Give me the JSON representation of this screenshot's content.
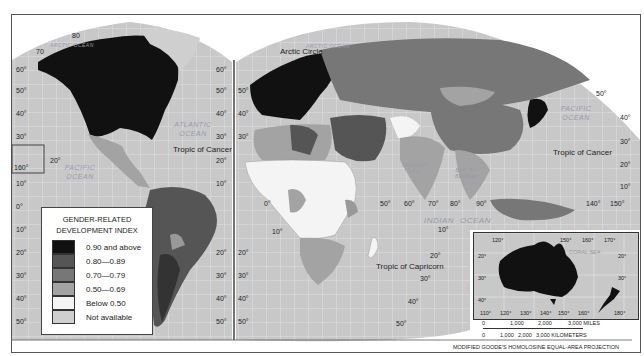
{
  "map": {
    "projection_note": "MODIFIED GOODE'S HOMOLOSINE EQUAL-AREA PROJECTION",
    "colors": {
      "ocean": "#c8c8c8",
      "grid": "#e8e8e8",
      "gdi_090_above": "#111111",
      "gdi_080_089": "#555555",
      "gdi_070_079": "#777777",
      "gdi_050_069": "#a3a3a3",
      "gdi_below_050": "#f4f4f4",
      "not_available": "#cfcfcf"
    },
    "labels": {
      "arctic_circle": "Arctic Circle",
      "tropic_cancer_west": "Tropic of Cancer",
      "tropic_cancer_east": "Tropic of Cancer",
      "tropic_capricorn": "Tropic of Capricorn",
      "arctic_ocean_west": "ARCTIC OCEAN",
      "arctic_ocean_east": "ARCTIC OCEAN",
      "atlantic_ocean": "ATLANTIC OCEAN",
      "pacific_ocean_west": "PACIFIC OCEAN",
      "pacific_ocean_east": "PACIFIC OCEAN",
      "indian_ocean_1": "INDIAN",
      "indian_ocean_2": "OCEAN",
      "arabian_sea": "ARABIAN SEA",
      "bay_of_bengal": "BAY OF BENGAL",
      "coral_sea": "CORAL SEA"
    },
    "lat_ticks_west": [
      "80",
      "70",
      "60°",
      "50°",
      "40°",
      "30°",
      "20°",
      "160°",
      "10°",
      "0°",
      "10°",
      "20°",
      "30°",
      "40°",
      "50°"
    ],
    "lat_ticks_mid": [
      "60°",
      "50°",
      "40°",
      "30°",
      "20°",
      "10°",
      "20°",
      "30°",
      "40°",
      "50°"
    ],
    "lon_ticks_africa": [
      "0°",
      "10°",
      "50°",
      "60°",
      "70°",
      "80°",
      "90°"
    ],
    "lon_ticks_asia": [
      "140°",
      "150°"
    ],
    "lat_ticks_east": [
      "50°",
      "40°",
      "30°",
      "20°",
      "10°",
      "10°",
      "20°",
      "30°",
      "40°",
      "50°"
    ]
  },
  "legend": {
    "title_line1": "GENDER-RELATED",
    "title_line2": "DEVELOPMENT INDEX",
    "items": [
      {
        "label": "0.90 and above",
        "color": "#111111"
      },
      {
        "label": "0.80—0.89",
        "color": "#555555"
      },
      {
        "label": "0.70—0.79",
        "color": "#777777"
      },
      {
        "label": "0.50—0.69",
        "color": "#a3a3a3"
      },
      {
        "label": "Below 0.50",
        "color": "#f4f4f4"
      },
      {
        "label": "Not available",
        "color": "#cfcfcf"
      }
    ]
  },
  "inset": {
    "top_lon": [
      "120°",
      "150°",
      "160°",
      "170°"
    ],
    "bottom_lon": [
      "110°",
      "120°",
      "130°",
      "140°",
      "150°",
      "160°",
      "180°"
    ],
    "lat": [
      "20°",
      "30°",
      "40°",
      "20°",
      "30°"
    ],
    "coral_sea": "CORAL SEA"
  },
  "scale": {
    "miles": [
      "0",
      "1,000",
      "2,000",
      "3,000 MILES"
    ],
    "km": [
      "0",
      "1,000",
      "2,000",
      "3,000 KILOMETERS"
    ]
  }
}
